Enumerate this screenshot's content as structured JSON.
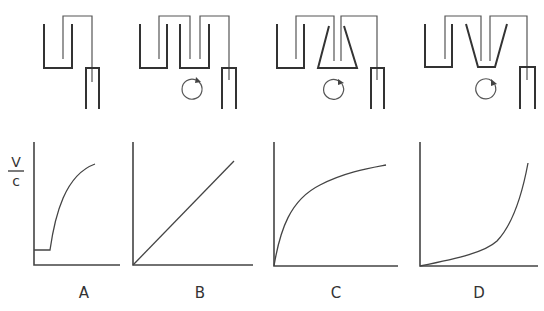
{
  "figure": {
    "panels": [
      {
        "id": "A",
        "label": "A",
        "apparatus": "single reservoir siphoned into receiver tube",
        "stirrer": false,
        "curve": "lag then saturating rise"
      },
      {
        "id": "B",
        "label": "B",
        "apparatus": "two rectangular vessels in series with stirrer",
        "stirrer": true,
        "curve": "linear"
      },
      {
        "id": "C",
        "label": "C",
        "apparatus": "rectangular vessel then trapezoid (wide-bottom) vessel with stirrer",
        "stirrer": true,
        "curve": "concave saturating"
      },
      {
        "id": "D",
        "label": "D",
        "apparatus": "rectangular vessel then inverted trapezoid (narrow-bottom) vessel with stirrer",
        "stirrer": true,
        "curve": "convex exponential-like"
      }
    ],
    "y_axis_label_numerator": "V",
    "y_axis_label_denominator": "c"
  }
}
